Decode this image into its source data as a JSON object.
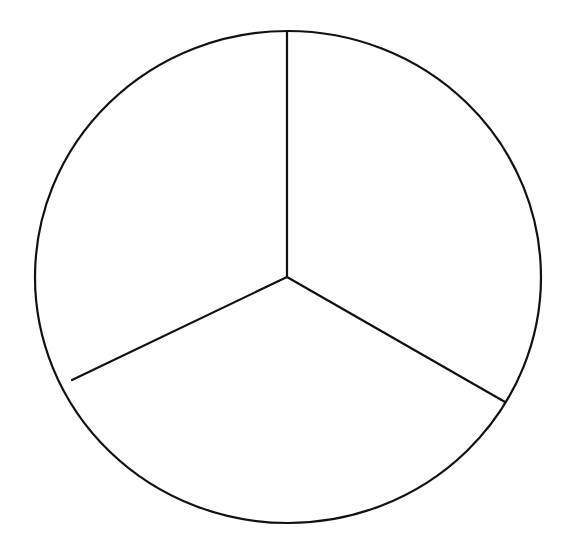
{
  "diagram": {
    "type": "circle-divided-into-thirds",
    "segment_count": 3,
    "segment_angle_degrees": 120,
    "segments": [
      {
        "name": "upper-right",
        "label": "",
        "filled": false
      },
      {
        "name": "bottom",
        "label": "",
        "filled": false
      },
      {
        "name": "upper-left",
        "label": "",
        "filled": false
      }
    ],
    "colors": {
      "background": "#ffffff",
      "stroke": "#111111",
      "fill": "#ffffff"
    }
  }
}
